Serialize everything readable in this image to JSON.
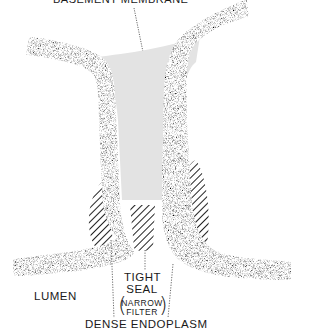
{
  "labels": {
    "top": "BASEMENT MEMBRANE",
    "lumen": "LUMEN",
    "tight_seal_line1": "TIGHT",
    "tight_seal_line2": "SEAL",
    "filter_line1": "NARROW",
    "filter_line2": "FILTER",
    "paren_open": "(",
    "paren_close": ")",
    "dense_endoplasm": "DENSE ENDOPLASM"
  },
  "colors": {
    "membrane_fill": "#9a9a9a",
    "membrane_outline": "#111111",
    "basement_fill": "#e3e3e3",
    "hatch": "#222222",
    "background": "#ffffff"
  }
}
